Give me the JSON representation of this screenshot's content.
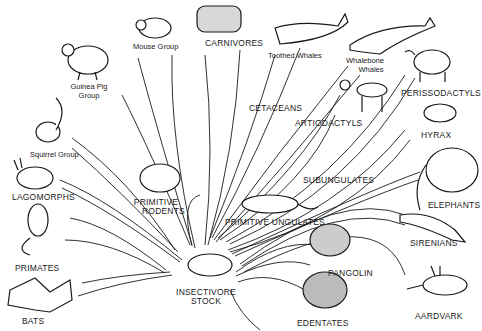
{
  "root": {
    "label_line1": "INSECTIVORE",
    "label_line2": "STOCK"
  },
  "groups": {
    "guinea_pig": {
      "line1": "Guinea Pig",
      "line2": "Group"
    },
    "mouse": "Mouse Group",
    "carnivores": "CARNIVORES",
    "toothed_whales": "Toothed Whales",
    "whalebone_whales": {
      "line1": "Whalebone",
      "line2": "Whales"
    },
    "perissodactyls": "PERISSODACTYLS",
    "cetaceans": "CETACEANS",
    "artiodactyls": "ARTIODACTYLS",
    "hyrax": "HYRAX",
    "squirrel": "Squirrel Group",
    "lagomorphs": "LAGOMORPHS",
    "primitive_rodents": {
      "line1": "PRIMITIVE",
      "line2": "RODENTS"
    },
    "subungulates": "SUBUNGULATES",
    "elephants": "ELEPHANTS",
    "primitive_ungulates": "PRIMITIVE UNGULATES",
    "sirenians": "SIRENIANS",
    "primates": "PRIMATES",
    "pangolin": "PANGOLIN",
    "bats": "BATS",
    "edentates": "EDENTATES",
    "aardvark": "AARDVARK"
  },
  "colors": {
    "ink": "#1a1a1a",
    "background": "#ffffff"
  }
}
